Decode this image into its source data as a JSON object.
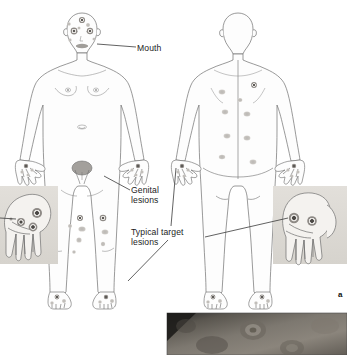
{
  "figure": {
    "panel_letter": "a",
    "background_color": "#ffffff",
    "width": 347,
    "height": 355,
    "top_clipped_text": ""
  },
  "labels": [
    {
      "id": "mouth",
      "text": "Mouth",
      "name": "label-mouth",
      "leader_from": [
        136,
        47
      ],
      "leader_to": [
        97,
        41
      ]
    },
    {
      "id": "genital",
      "text": "Genital\nlesions",
      "name": "label-genital-lesions",
      "leader_from": [
        130,
        190
      ],
      "leader_to": [
        104,
        176
      ]
    },
    {
      "id": "target",
      "text": "Typical target\nlesions",
      "name": "label-typical-target-lesions",
      "leader_from": [
        171,
        226
      ],
      "leader_to": [
        176,
        168
      ]
    }
  ],
  "body_diagrams": [
    {
      "id": "anterior",
      "name": "anterior-body-diagram",
      "view": "front",
      "outline_color": "#6a6a6a",
      "fill_color": "#fdfdfd"
    },
    {
      "id": "posterior",
      "name": "posterior-body-diagram",
      "view": "back",
      "outline_color": "#6a6a6a",
      "fill_color": "#fdfdfd"
    }
  ],
  "lesions": {
    "target_lesion_ring_color": "#8e8a86",
    "target_lesion_center_color": "#5d5a57",
    "macule_color": "#c3c0bc",
    "genital_patch_color": "#9b9896"
  },
  "insets": [
    {
      "id": "left-hand",
      "name": "hand-inset-left",
      "caption": "",
      "background_color": "#dedbd6",
      "lesion_count": 3,
      "rect": [
        0,
        186,
        58,
        78
      ]
    },
    {
      "id": "right-hand",
      "name": "hand-inset-right",
      "caption": "",
      "background_color": "#dedbd6",
      "lesion_count": 2,
      "rect": [
        273,
        186,
        74,
        78
      ]
    }
  ],
  "photograph": {
    "id": "clinical-photo",
    "name": "clinical-photograph",
    "caption": "",
    "type": "grayscale-clinical-photo",
    "rect": [
      167,
      313,
      180,
      42
    ]
  }
}
